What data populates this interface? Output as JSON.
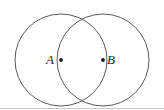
{
  "figure": {
    "background_color": "#ffffff",
    "stroke_color": "#595959",
    "dot_color": "#1a1a1a",
    "rule_color": "#c9c9c9",
    "width": 164,
    "height": 110,
    "labels": {
      "left_point": "A",
      "right_point": "B"
    },
    "geometry": {
      "left_circle": {
        "cx": 61,
        "cy": 60,
        "r": 46
      },
      "right_circle": {
        "cx": 103,
        "cy": 60,
        "r": 46
      },
      "points": [
        {
          "name": "A",
          "x": 61,
          "y": 60
        },
        {
          "name": "B",
          "x": 103,
          "y": 60
        }
      ],
      "intersections": [
        {
          "x": 82,
          "y": 19
        },
        {
          "x": 82,
          "y": 101
        }
      ],
      "baseline_rule": {
        "x1": 0,
        "y1": 108,
        "x2": 164,
        "y2": 108
      }
    }
  }
}
